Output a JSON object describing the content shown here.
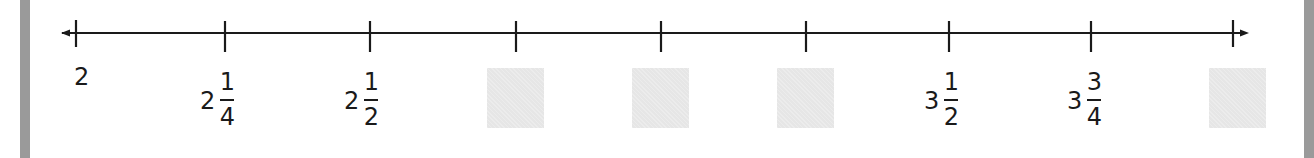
{
  "number_line": {
    "start": 2,
    "end": 4,
    "interval": "1/4",
    "arrows": "both",
    "axis_color": "#1a1a1a",
    "tick_x": [
      76,
      225,
      370,
      516,
      661,
      806,
      949,
      1091,
      1233
    ],
    "ticks": [
      {
        "value": "2",
        "type": "whole",
        "whole": "2"
      },
      {
        "value": "2 1/4",
        "type": "mixed",
        "whole": "2",
        "num": "1",
        "den": "4"
      },
      {
        "value": "2 1/2",
        "type": "mixed",
        "whole": "2",
        "num": "1",
        "den": "2"
      },
      {
        "value": "",
        "type": "blank"
      },
      {
        "value": "",
        "type": "blank"
      },
      {
        "value": "",
        "type": "blank"
      },
      {
        "value": "3 1/2",
        "type": "mixed",
        "whole": "3",
        "num": "1",
        "den": "2"
      },
      {
        "value": "3 3/4",
        "type": "mixed",
        "whole": "3",
        "num": "3",
        "den": "4"
      },
      {
        "value": "",
        "type": "blank"
      }
    ]
  },
  "answer_box_color": "#e6e6e6",
  "border_color": "#9a9a9a"
}
